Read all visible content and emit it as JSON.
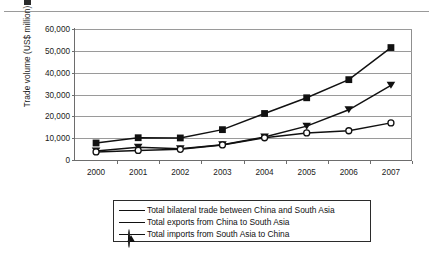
{
  "figure": {
    "top_rule": true,
    "caption_stub": true
  },
  "chart_data": {
    "type": "line",
    "title": "",
    "xlabel": "",
    "ylabel": "Trade volume (US$ million)",
    "categories": [
      "2000",
      "2001",
      "2002",
      "2003",
      "2004",
      "2005",
      "2006",
      "2007"
    ],
    "x": [
      2000,
      2001,
      2002,
      2003,
      2004,
      2005,
      2006,
      2007
    ],
    "ylim": [
      0,
      60000
    ],
    "ytick_labels": [
      "0",
      "10,000",
      "20,000",
      "30,000",
      "40,000",
      "50,000",
      "60,000"
    ],
    "ytick_values": [
      0,
      10000,
      20000,
      30000,
      40000,
      50000,
      60000
    ],
    "grid": true,
    "grid_axis": "y",
    "legend_position": "bottom",
    "series": [
      {
        "name": "Total bilateral trade between China and South Asia",
        "marker": "filled-square",
        "color": "#111111",
        "values": [
          7800,
          10200,
          10100,
          13900,
          21300,
          28500,
          36800,
          51500
        ]
      },
      {
        "name": "Total exports from China to South Asia",
        "marker": "filled-triangle",
        "color": "#111111",
        "values": [
          4100,
          5800,
          5200,
          7000,
          10500,
          15500,
          23000,
          34200
        ]
      },
      {
        "name": "Total imports from South Asia to China",
        "marker": "open-circle",
        "color": "#111111",
        "values": [
          3700,
          4400,
          4900,
          6900,
          10200,
          12400,
          13400,
          17000
        ]
      }
    ]
  }
}
